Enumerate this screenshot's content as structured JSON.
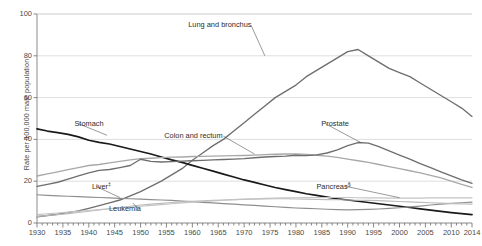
{
  "chart_data": {
    "type": "line",
    "title": "",
    "xlabel": "",
    "ylabel": "Rate per 100,000 male population",
    "xlim": [
      1930,
      2014
    ],
    "ylim": [
      0,
      100
    ],
    "yticks": [
      0,
      20,
      40,
      60,
      80,
      100
    ],
    "xticks": [
      1930,
      1935,
      1940,
      1945,
      1950,
      1955,
      1960,
      1965,
      1970,
      1975,
      1980,
      1985,
      1990,
      1995,
      2000,
      2005,
      2010,
      2014
    ],
    "grid": "horizontal",
    "legend_position": "inline-annotations",
    "minor_tick_interval": 1,
    "major_tick_interval": 5,
    "x": [
      1930,
      1932,
      1934,
      1936,
      1938,
      1940,
      1942,
      1944,
      1946,
      1948,
      1950,
      1952,
      1954,
      1956,
      1958,
      1960,
      1962,
      1964,
      1966,
      1968,
      1970,
      1972,
      1974,
      1976,
      1978,
      1980,
      1982,
      1984,
      1986,
      1988,
      1990,
      1992,
      1994,
      1996,
      1998,
      2000,
      2002,
      2004,
      2006,
      2008,
      2010,
      2012,
      2014
    ],
    "series": [
      {
        "name": "Lung and bronchus",
        "color": "#6e6e6e",
        "width": 1.35,
        "label_x": 1965,
        "label_y": 95,
        "values": [
          3,
          3.6,
          4.2,
          5,
          5.8,
          7,
          8.3,
          9.6,
          11,
          13,
          15,
          17.5,
          20,
          23,
          26,
          30,
          33.5,
          37,
          40,
          44,
          48,
          52,
          56,
          60,
          63,
          66,
          70,
          73,
          76,
          79,
          82,
          83,
          80,
          77,
          74,
          72,
          70,
          67,
          64,
          61,
          58,
          55,
          51
        ]
      },
      {
        "name": "Stomach",
        "color": "#1a1a1a",
        "width": 1.7,
        "label_x": 1938,
        "label_y": 48,
        "values": [
          45,
          44,
          43.2,
          42.4,
          41.2,
          39.6,
          38.6,
          37.8,
          36.6,
          35.4,
          34.2,
          33,
          31.6,
          30.2,
          29,
          27.6,
          26.2,
          24.8,
          23.4,
          22,
          20.6,
          19.4,
          18.2,
          17,
          16,
          15,
          14,
          13.2,
          12.4,
          11.6,
          11,
          10.4,
          9.8,
          9.2,
          8.6,
          8,
          7.4,
          6.8,
          6.2,
          5.6,
          5,
          4.5,
          4
        ]
      },
      {
        "name": "Colon and rectum",
        "color": "#a8a8a8",
        "width": 1.35,
        "label_x": 1965,
        "label_y": 42,
        "values": [
          22.5,
          23.5,
          24.5,
          25.5,
          26.5,
          27.5,
          28,
          28.8,
          29.5,
          30.2,
          30.8,
          31,
          31.3,
          31.5,
          31.6,
          31.8,
          31.9,
          32,
          32.1,
          32.2,
          32.3,
          32.5,
          32.7,
          32.9,
          33,
          33.1,
          32.8,
          32.4,
          32,
          31.4,
          30.6,
          29.8,
          29,
          28,
          27,
          26,
          25,
          24,
          22.8,
          21.6,
          20,
          18.5,
          17
        ]
      },
      {
        "name": "Prostate",
        "color": "#6e6e6e",
        "width": 1.35,
        "label_x": 1988,
        "label_y": 48,
        "values": [
          17.5,
          18.5,
          19.5,
          21,
          22.5,
          24,
          25.2,
          25.6,
          26.5,
          27.5,
          30.5,
          29.5,
          29.2,
          29.4,
          29.6,
          29.8,
          30,
          30.2,
          30.4,
          30.6,
          30.8,
          31.2,
          31.6,
          31.8,
          32,
          32.4,
          32.2,
          32.6,
          33.5,
          35,
          37,
          38.5,
          38.2,
          36.5,
          34.5,
          32.5,
          30.6,
          28.4,
          26.5,
          24.5,
          22.5,
          20.6,
          19
        ]
      },
      {
        "name": "Liver",
        "superscript": "‡",
        "color": "#8f8f8f",
        "width": 1.15,
        "label_x": 1941,
        "label_y": 18,
        "values": [
          13.5,
          13.2,
          13,
          12.8,
          12.6,
          12.4,
          12.2,
          12,
          11.8,
          11.6,
          11.4,
          11.2,
          11,
          10.8,
          10.5,
          10.2,
          9.9,
          9.6,
          9.3,
          9,
          8.7,
          8.4,
          8.1,
          7.8,
          7.5,
          7.2,
          7,
          6.8,
          6.6,
          6.4,
          6.3,
          6.4,
          6.5,
          6.7,
          7,
          7.3,
          7.7,
          8.1,
          8.6,
          9,
          9.4,
          9.7,
          10
        ]
      },
      {
        "name": "Leukemia",
        "color": "#bcbcbc",
        "width": 1.15,
        "label_x": 1952,
        "label_y": 7,
        "values": [
          3.2,
          3.6,
          4,
          4.5,
          5,
          5.6,
          6.2,
          6.8,
          7.4,
          8,
          8.6,
          9,
          9.4,
          9.8,
          10.1,
          10.4,
          10.6,
          10.8,
          11,
          11.2,
          11.3,
          11.4,
          11.5,
          11.6,
          11.6,
          11.5,
          11.4,
          11.3,
          11.2,
          11.1,
          11,
          10.9,
          10.8,
          10.7,
          10.5,
          10.3,
          10.1,
          9.9,
          9.7,
          9.5,
          9.3,
          9.1,
          9
        ]
      },
      {
        "name": "Pancreas",
        "superscript": "§",
        "color": "#c4c4c4",
        "width": 1.15,
        "label_x": 1994,
        "label_y": 18,
        "values": [
          4,
          4.4,
          4.8,
          5.2,
          5.6,
          6,
          6.4,
          6.8,
          7.2,
          7.6,
          8,
          8.4,
          8.8,
          9.2,
          9.6,
          10,
          10.3,
          10.6,
          10.9,
          11.2,
          11.4,
          11.6,
          11.8,
          11.9,
          12,
          12.1,
          12.2,
          12.2,
          12.2,
          12.2,
          12.2,
          12.1,
          12,
          12,
          11.9,
          11.9,
          11.9,
          11.9,
          12,
          12,
          12,
          12,
          12
        ]
      }
    ]
  },
  "axis": {
    "y_label": "Rate per 100,000 male population",
    "y_ticks": [
      "100",
      "80",
      "60",
      "40",
      "20",
      "0"
    ],
    "x_ticks": [
      "1930",
      "1935",
      "1940",
      "1945",
      "1950",
      "1955",
      "1960",
      "1965",
      "1970",
      "1975",
      "1980",
      "1985",
      "1990",
      "1995",
      "2000",
      "2005",
      "2010",
      "2014"
    ]
  },
  "annotations": [
    {
      "text": "Lung and bronchus"
    },
    {
      "text": "Stomach"
    },
    {
      "text": "Colon and rectum"
    },
    {
      "text": "Prostate"
    },
    {
      "text": "Liver"
    },
    {
      "text": "Leukemia"
    },
    {
      "text": "Pancreas"
    }
  ]
}
